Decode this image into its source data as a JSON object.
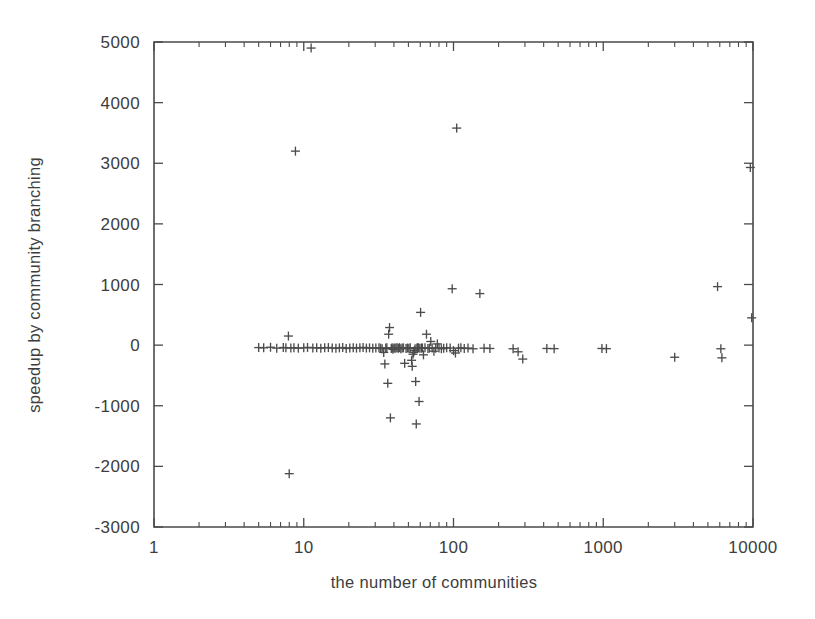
{
  "figure": {
    "background_color": "#ffffff",
    "ink_color": "#4a4a4a",
    "marker_symbol": "plus",
    "marker_size_px": 9
  },
  "chart_data": {
    "type": "scatter",
    "title": "",
    "xlabel": "the number of communities",
    "ylabel": "speedup by community branching",
    "xscale": "log",
    "yscale": "linear",
    "xlim": [
      1,
      10000
    ],
    "ylim": [
      -3000,
      5000
    ],
    "grid": false,
    "legend": null,
    "xticks": [
      1,
      10,
      100,
      1000,
      10000
    ],
    "xticklabels": [
      "1",
      "10",
      "100",
      "1000",
      "10000"
    ],
    "yticks": [
      -3000,
      -2000,
      -1000,
      0,
      1000,
      2000,
      3000,
      4000,
      5000
    ],
    "yticklabels": [
      "-3000",
      "-2000",
      "-1000",
      "0",
      "1000",
      "2000",
      "3000",
      "4000",
      "5000"
    ],
    "x_minor_ticks_per_decade": [
      2,
      3,
      4,
      5,
      6,
      7,
      8,
      9
    ],
    "series": [
      {
        "name": "speedup by community branching",
        "marker": "+",
        "color": "#4c4c4c",
        "points": [
          [
            5.0,
            -40
          ],
          [
            5.4,
            -45
          ],
          [
            6.0,
            -35
          ],
          [
            6.6,
            -50
          ],
          [
            7.3,
            -40
          ],
          [
            7.6,
            -45
          ],
          [
            7.9,
            150
          ],
          [
            8.0,
            -2120
          ],
          [
            8.2,
            -48
          ],
          [
            8.6,
            -42
          ],
          [
            8.8,
            3200
          ],
          [
            9.2,
            -50
          ],
          [
            10.0,
            -45
          ],
          [
            10.6,
            -38
          ],
          [
            11.2,
            4900
          ],
          [
            11.5,
            -46
          ],
          [
            12.2,
            -42
          ],
          [
            13.0,
            -50
          ],
          [
            13.8,
            -44
          ],
          [
            14.6,
            -40
          ],
          [
            15.5,
            -48
          ],
          [
            16.4,
            -52
          ],
          [
            17.3,
            -45
          ],
          [
            18.2,
            -40
          ],
          [
            19.2,
            -55
          ],
          [
            20.3,
            -46
          ],
          [
            21.4,
            -43
          ],
          [
            22.5,
            -50
          ],
          [
            23.7,
            -44
          ],
          [
            24.9,
            -38
          ],
          [
            26.2,
            -48
          ],
          [
            27.5,
            -45
          ],
          [
            28.9,
            -52
          ],
          [
            30.3,
            -47
          ],
          [
            31.8,
            -43
          ],
          [
            32.6,
            -50
          ],
          [
            33.4,
            -60
          ],
          [
            34.2,
            -120
          ],
          [
            34.8,
            -310
          ],
          [
            35.3,
            -48
          ],
          [
            35.9,
            -44
          ],
          [
            36.4,
            -630
          ],
          [
            36.9,
            180
          ],
          [
            37.4,
            290
          ],
          [
            37.9,
            -1200
          ],
          [
            38.4,
            -55
          ],
          [
            38.9,
            -45
          ],
          [
            39.4,
            -70
          ],
          [
            40.0,
            -48
          ],
          [
            40.6,
            -52
          ],
          [
            41.3,
            -46
          ],
          [
            42.0,
            -44
          ],
          [
            42.8,
            -50
          ],
          [
            43.6,
            -42
          ],
          [
            44.5,
            -58
          ],
          [
            45.4,
            -47
          ],
          [
            46.3,
            -45
          ],
          [
            47.2,
            -300
          ],
          [
            48.2,
            -55
          ],
          [
            49.2,
            -48
          ],
          [
            50.3,
            -50
          ],
          [
            51.4,
            -44
          ],
          [
            52.5,
            -250
          ],
          [
            53.0,
            -350
          ],
          [
            53.6,
            -150
          ],
          [
            54.2,
            -120
          ],
          [
            54.8,
            -90
          ],
          [
            55.4,
            -60
          ],
          [
            55.9,
            -600
          ],
          [
            56.4,
            -1300
          ],
          [
            57.0,
            -48
          ],
          [
            57.6,
            -46
          ],
          [
            58.2,
            -44
          ],
          [
            58.9,
            -930
          ],
          [
            59.6,
            -52
          ],
          [
            60.3,
            540
          ],
          [
            61.0,
            -50
          ],
          [
            62.0,
            -45
          ],
          [
            63.0,
            -160
          ],
          [
            64.5,
            -42
          ],
          [
            66.0,
            180
          ],
          [
            67.5,
            -55
          ],
          [
            69.0,
            -50
          ],
          [
            70.5,
            60
          ],
          [
            72.0,
            -48
          ],
          [
            74.0,
            -100
          ],
          [
            76.0,
            -52
          ],
          [
            78.0,
            20
          ],
          [
            80.0,
            -46
          ],
          [
            83.0,
            -60
          ],
          [
            86.0,
            -50
          ],
          [
            90.0,
            -44
          ],
          [
            95.0,
            -48
          ],
          [
            98.0,
            930
          ],
          [
            100.0,
            -90
          ],
          [
            103.0,
            -130
          ],
          [
            105.0,
            3580
          ],
          [
            108.0,
            -50
          ],
          [
            112.0,
            -45
          ],
          [
            118.0,
            -55
          ],
          [
            125.0,
            -48
          ],
          [
            135.0,
            -60
          ],
          [
            150.0,
            850
          ],
          [
            160.0,
            -50
          ],
          [
            175.0,
            -55
          ],
          [
            250.0,
            -60
          ],
          [
            270.0,
            -110
          ],
          [
            290.0,
            -230
          ],
          [
            420.0,
            -55
          ],
          [
            470.0,
            -58
          ],
          [
            980.0,
            -55
          ],
          [
            1050.0,
            -58
          ],
          [
            3000.0,
            -200
          ],
          [
            5800.0,
            965
          ],
          [
            6100.0,
            -60
          ],
          [
            6200.0,
            -210
          ],
          [
            9600.0,
            2930
          ],
          [
            9800.0,
            450
          ]
        ]
      }
    ]
  },
  "axes_geometry": {
    "plot_left_px": 154,
    "plot_right_px": 753,
    "plot_top_px": 42,
    "plot_bottom_px": 527
  }
}
